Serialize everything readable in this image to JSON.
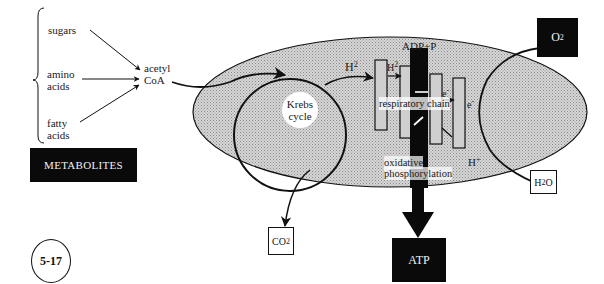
{
  "figure_number": "5-17",
  "metabolites": {
    "title": "METABOLITES",
    "items": [
      "sugars",
      "amino",
      "acids",
      "fatty",
      "acids"
    ]
  },
  "sugars_label": "sugars",
  "amino_line1": "amino",
  "amino_line2": "acids",
  "fatty_line1": "fatty",
  "fatty_line2": "acids",
  "acetyl_line1": "acetyl",
  "acetyl_line2": "CoA",
  "krebs_line1": "Krebs",
  "krebs_line2": "cycle",
  "h2_left": "H",
  "h2_left_sup": "2",
  "h2_inner": "H",
  "h2_inner_sup": "2",
  "adp_label": "ADP+P",
  "electron_label": "e",
  "electron_sup": "-",
  "electron_right": "e",
  "electron_right_sup": "-",
  "respiratory_chain": "respiratory chain",
  "oxidative_line1": "oxidative",
  "oxidative_line2": "phosphorylation",
  "hplus": "H",
  "hplus_sup": "+",
  "o2": {
    "main": "O",
    "sub": "2"
  },
  "h2o": {
    "a": "H",
    "sub": "2",
    "b": "O"
  },
  "co2": {
    "main": "CO",
    "sub": "2"
  },
  "atp": "ATP",
  "colors": {
    "ellipse_fill": "#c8c8c8",
    "black": "#0a0a0a",
    "stroke": "#111111"
  }
}
